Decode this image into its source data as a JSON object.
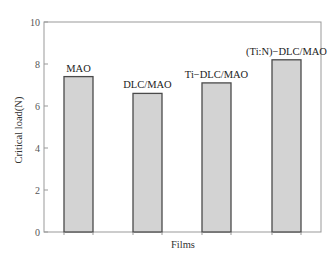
{
  "chart_data": {
    "type": "bar",
    "title": "",
    "xlabel": "Films",
    "ylabel": "Critical load(N)",
    "ylim": [
      0,
      10
    ],
    "yticks": [
      0,
      2,
      4,
      6,
      8,
      10
    ],
    "grid": false,
    "legend": null,
    "categories": [
      "MAO",
      "DLC/MAO",
      "Ti−DLC/MAO",
      "(Ti:N)−DLC/MAO"
    ],
    "values": [
      7.4,
      6.6,
      7.1,
      8.2
    ],
    "bar_labels": [
      "MAO",
      "DLC/MAO",
      "Ti−DLC/MAO",
      "(Ti:N)−DLC/MAO"
    ],
    "colors": {
      "bar_fill": "#d3d3d3",
      "bar_edge": "#4a4a4a",
      "axis": "#999999"
    }
  }
}
